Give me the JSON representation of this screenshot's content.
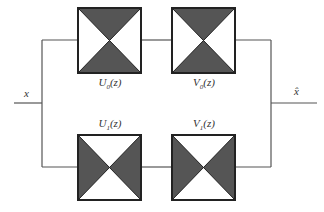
{
  "diagram": {
    "type": "two-channel filter bank",
    "input_label": "x",
    "output_label": "x̂",
    "colors": {
      "line": "#555555",
      "box_border": "#222222",
      "fill_dark": "#555555",
      "fill_light": "#ffffff"
    },
    "blocks": [
      {
        "id": "U0",
        "name": "U",
        "sub": "0",
        "arg": "(z)",
        "branch": "upper",
        "stage": "analysis",
        "shaded": "top-bottom"
      },
      {
        "id": "V0",
        "name": "V",
        "sub": "0",
        "arg": "(z)",
        "branch": "upper",
        "stage": "synthesis",
        "shaded": "top-bottom"
      },
      {
        "id": "U1",
        "name": "U",
        "sub": "1",
        "arg": "(z)",
        "branch": "lower",
        "stage": "analysis",
        "shaded": "left-right"
      },
      {
        "id": "V1",
        "name": "V",
        "sub": "1",
        "arg": "(z)",
        "branch": "lower",
        "stage": "synthesis",
        "shaded": "left-right"
      }
    ]
  }
}
